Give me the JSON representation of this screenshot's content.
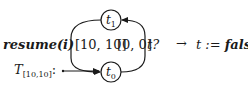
{
  "diagram": {
    "type": "timed-automaton",
    "automaton_name": {
      "base": "T",
      "subscript": "[10,10]",
      "suffix": ":"
    },
    "nodes": [
      {
        "id": "t1",
        "base": "t",
        "subscript": "1",
        "role": "upper-state"
      },
      {
        "id": "t0",
        "base": "t",
        "subscript": "0",
        "role": "initial-state"
      }
    ],
    "edges": [
      {
        "from": "t1",
        "to": "t0",
        "side": "left",
        "interval": "[10, 10]",
        "trigger": "resume(i)"
      },
      {
        "from": "t0",
        "to": "t1",
        "side": "right",
        "interval": "[0, 0]",
        "trigger": "t?"
      }
    ],
    "labels": {
      "resume": "resume(i)",
      "left_interval": "[10, 10]",
      "right_interval": "[0, 0]",
      "query": "t?",
      "arrow": "→",
      "assignment_var": "t := ",
      "assignment_value": "false"
    },
    "colors": {
      "ink": "#1a1a1a",
      "background": "#ffffff"
    }
  }
}
